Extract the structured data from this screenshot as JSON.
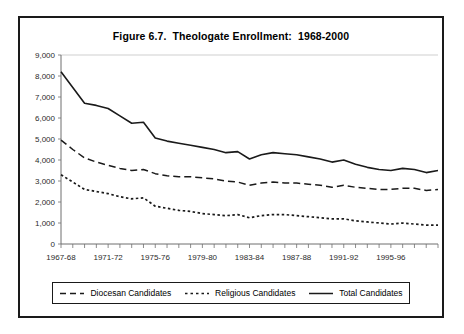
{
  "figure": {
    "title": "Figure 6.7.  Theologate Enrollment:  1968-2000"
  },
  "legend": {
    "entries": [
      {
        "label": "Diocesan Candidates",
        "style": "dashed",
        "swatch": "dashed-line-swatch"
      },
      {
        "label": "Religious Candidates",
        "style": "dotted",
        "swatch": "dotted-line-swatch"
      },
      {
        "label": "Total Candidates",
        "style": "solid",
        "swatch": "solid-line-swatch"
      }
    ]
  },
  "chart_data": {
    "type": "line",
    "title": "Figure 6.7.  Theologate Enrollment:  1968-2000",
    "xlabel": "",
    "ylabel": "",
    "grid": false,
    "legend_position": "bottom",
    "ylim": [
      0,
      9000
    ],
    "ytick_labels": [
      "0",
      "1,000",
      "2,000",
      "3,000",
      "4,000",
      "5,000",
      "6,000",
      "7,000",
      "8,000",
      "9,000"
    ],
    "ytick_values": [
      0,
      1000,
      2000,
      3000,
      4000,
      5000,
      6000,
      7000,
      8000,
      9000
    ],
    "x": [
      "1967-68",
      "1968-69",
      "1969-70",
      "1970-71",
      "1971-72",
      "1972-73",
      "1973-74",
      "1974-75",
      "1975-76",
      "1976-77",
      "1977-78",
      "1978-79",
      "1979-80",
      "1980-81",
      "1981-82",
      "1982-83",
      "1983-84",
      "1984-85",
      "1985-86",
      "1986-87",
      "1987-88",
      "1988-89",
      "1989-90",
      "1990-91",
      "1991-92",
      "1992-93",
      "1993-94",
      "1994-95",
      "1995-96",
      "1996-97",
      "1997-98",
      "1998-99",
      "1999-2000"
    ],
    "xtick_labels_shown": [
      "1967-68",
      "1971-72",
      "1975-76",
      "1979-80",
      "1983-84",
      "1987-88",
      "1991-92",
      "1995-96"
    ],
    "xtick_label_interval": 4,
    "series": [
      {
        "name": "Total Candidates",
        "style": "solid",
        "values": [
          8200,
          7450,
          6700,
          6600,
          6450,
          6100,
          5750,
          5800,
          5050,
          4900,
          4800,
          4700,
          4600,
          4500,
          4350,
          4400,
          4050,
          4250,
          4350,
          4300,
          4250,
          4150,
          4050,
          3900,
          4000,
          3800,
          3650,
          3550,
          3500,
          3600,
          3550,
          3400,
          3500
        ]
      },
      {
        "name": "Diocesan Candidates",
        "style": "dashed",
        "values": [
          4950,
          4500,
          4100,
          3900,
          3750,
          3600,
          3500,
          3550,
          3350,
          3250,
          3200,
          3200,
          3150,
          3100,
          3000,
          2950,
          2800,
          2900,
          2950,
          2900,
          2900,
          2850,
          2800,
          2700,
          2800,
          2700,
          2650,
          2600,
          2600,
          2650,
          2650,
          2550,
          2600
        ]
      },
      {
        "name": "Religious Candidates",
        "style": "dotted",
        "values": [
          3300,
          2950,
          2600,
          2500,
          2400,
          2250,
          2150,
          2200,
          1800,
          1700,
          1600,
          1550,
          1450,
          1400,
          1350,
          1400,
          1250,
          1350,
          1400,
          1400,
          1350,
          1300,
          1250,
          1200,
          1200,
          1100,
          1050,
          1000,
          950,
          1000,
          950,
          900,
          900
        ]
      }
    ]
  }
}
